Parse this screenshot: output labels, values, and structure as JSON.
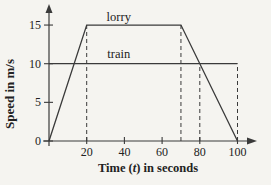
{
  "chart_data": {
    "type": "line",
    "title": "",
    "xlabel": "Time (t) in seconds",
    "xlabel_parts": [
      {
        "text": "Time ("
      },
      {
        "text": "t",
        "italic": true
      },
      {
        "text": ") in seconds"
      }
    ],
    "ylabel": "Speed in m/s",
    "xlim": [
      0,
      110
    ],
    "ylim": [
      0,
      17.5
    ],
    "x_ticks": [
      20,
      40,
      60,
      80,
      100
    ],
    "y_ticks": [
      0,
      5,
      10,
      15
    ],
    "grid": false,
    "legend_position": "inline",
    "series": [
      {
        "name": "lorry",
        "points": [
          [
            0,
            0
          ],
          [
            20,
            15
          ],
          [
            70,
            15
          ],
          [
            100,
            0
          ]
        ],
        "label": {
          "text": "lorry",
          "x": 37,
          "y": 15.5
        }
      },
      {
        "name": "train",
        "points": [
          [
            0,
            10
          ],
          [
            100,
            10
          ]
        ],
        "label": {
          "text": "train",
          "x": 37,
          "y": 10.8
        }
      }
    ],
    "dashed_guides": [
      {
        "x": 20,
        "y_from": 0,
        "y_to": 15
      },
      {
        "x": 70,
        "y_from": 0,
        "y_to": 15
      },
      {
        "x": 80,
        "y_from": 0,
        "y_to": 10
      },
      {
        "x": 100,
        "y_from": 0,
        "y_to": 10
      }
    ],
    "colors": {
      "ink": "#3a3a3a",
      "text": "#222222",
      "paper": "#f5f4f0"
    }
  }
}
